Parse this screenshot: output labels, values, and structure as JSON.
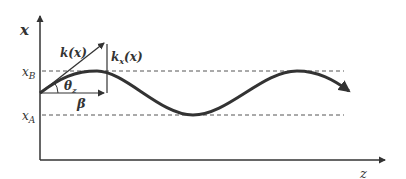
{
  "diagram": {
    "type": "wave-propagation",
    "axes": {
      "vertical_label": "x",
      "horizontal_label": "z"
    },
    "levels": {
      "upper": {
        "base": "x",
        "sub": "B"
      },
      "lower": {
        "base": "x",
        "sub": "A"
      }
    },
    "vectors": {
      "k": {
        "base": "k",
        "arg": "(x)"
      },
      "kx": {
        "base": "k",
        "sub": "x",
        "arg": "(x)"
      },
      "beta": "β"
    },
    "angle": {
      "base": "θ",
      "sub": "z"
    },
    "colors": {
      "stroke": "#333333",
      "dashed": "#555555",
      "background": "#ffffff"
    }
  }
}
